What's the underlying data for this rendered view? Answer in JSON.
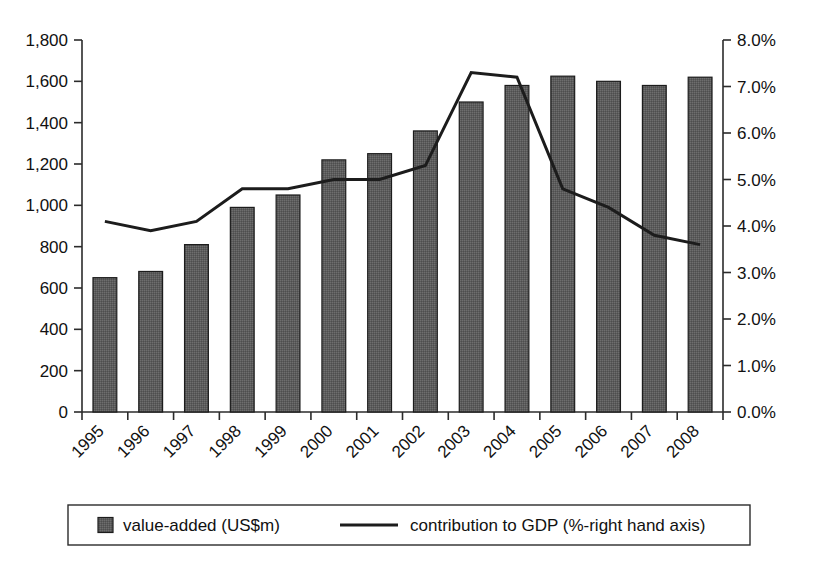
{
  "chart_data": {
    "type": "bar",
    "title": "",
    "subtitle": "",
    "xlabel": "",
    "ylabel": "",
    "grid": false,
    "legend_position": "bottom",
    "categories": [
      "1995",
      "1996",
      "1997",
      "1998",
      "1999",
      "2000",
      "2001",
      "2002",
      "2003",
      "2004",
      "2005",
      "2006",
      "2007",
      "2008"
    ],
    "series": [
      {
        "name": "value-added (US$m)",
        "type": "bar",
        "axis": "left",
        "values": [
          650,
          680,
          810,
          990,
          1050,
          1220,
          1250,
          1360,
          1500,
          1580,
          1625,
          1600,
          1580,
          1620
        ]
      },
      {
        "name": "contribution to GDP (%-right hand axis)",
        "type": "line",
        "axis": "right",
        "values": [
          4.1,
          3.9,
          4.1,
          4.8,
          4.8,
          5.0,
          5.0,
          5.3,
          7.3,
          7.2,
          4.8,
          4.4,
          3.8,
          3.6
        ]
      }
    ],
    "left_axis": {
      "min": 0,
      "max": 1800,
      "step": 200,
      "ticks": [
        "0",
        "200",
        "400",
        "600",
        "800",
        "1,000",
        "1,200",
        "1,400",
        "1,600",
        "1,800"
      ]
    },
    "right_axis": {
      "min": 0,
      "max": 8,
      "step": 1,
      "ticks": [
        "0.0%",
        "1.0%",
        "2.0%",
        "3.0%",
        "4.0%",
        "5.0%",
        "6.0%",
        "7.0%",
        "8.0%"
      ]
    },
    "colors": {
      "bar_fill": "#595959",
      "bar_stroke": "#1c1c1c",
      "line": "#1c1c1c",
      "axis": "#2b2b2b",
      "text": "#111111",
      "background": "#ffffff"
    }
  },
  "legend": {
    "items": [
      {
        "label": "value-added (US$m)",
        "marker": "filled-square"
      },
      {
        "label": "contribution to GDP (%-right hand axis)",
        "marker": "line"
      }
    ]
  }
}
